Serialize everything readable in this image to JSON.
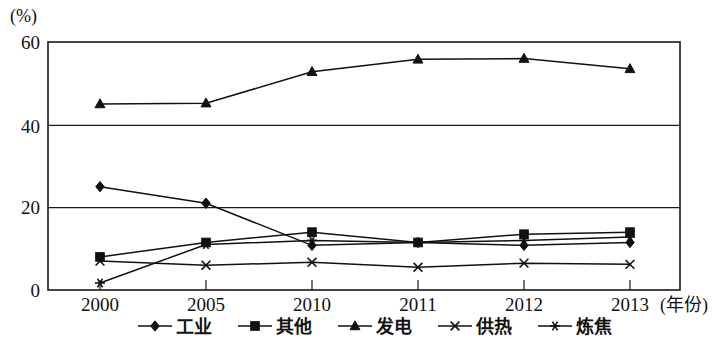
{
  "chart_data": {
    "type": "line",
    "title": "",
    "unit_label": "(%)",
    "xlabel": "(年份)",
    "ylabel": "",
    "categories": [
      "2000",
      "2005",
      "2010",
      "2011",
      "2012",
      "2013"
    ],
    "ylim": [
      0,
      60
    ],
    "yticks": [
      0,
      20,
      40,
      60
    ],
    "grid": true,
    "legend_position": "bottom",
    "series": [
      {
        "name": "工业",
        "marker": "diamond",
        "values": [
          25.0,
          21.0,
          10.8,
          11.5,
          10.8,
          11.5
        ]
      },
      {
        "name": "其他",
        "marker": "square",
        "values": [
          8.0,
          11.5,
          14.0,
          11.5,
          13.5,
          14.0
        ]
      },
      {
        "name": "发电",
        "marker": "triangle",
        "values": [
          45.0,
          45.2,
          52.8,
          55.8,
          56.0,
          53.5
        ]
      },
      {
        "name": "供热",
        "marker": "cross",
        "values": [
          7.0,
          6.0,
          6.7,
          5.5,
          6.5,
          6.2
        ]
      },
      {
        "name": "炼焦",
        "marker": "asterisk",
        "values": [
          1.7,
          11.0,
          12.0,
          11.5,
          12.0,
          12.8
        ]
      }
    ]
  },
  "legend": {
    "items": [
      {
        "label": "工业",
        "marker": "diamond"
      },
      {
        "label": "其他",
        "marker": "square"
      },
      {
        "label": "发电",
        "marker": "triangle"
      },
      {
        "label": "供热",
        "marker": "cross"
      },
      {
        "label": "炼焦",
        "marker": "asterisk"
      }
    ]
  },
  "axes": {
    "y_ticks": [
      "60",
      "40",
      "20",
      "0"
    ],
    "x_ticks": [
      "2000",
      "2005",
      "2010",
      "2011",
      "2012",
      "2013"
    ],
    "unit": "(%)",
    "x_axis_name": "(年份)"
  }
}
